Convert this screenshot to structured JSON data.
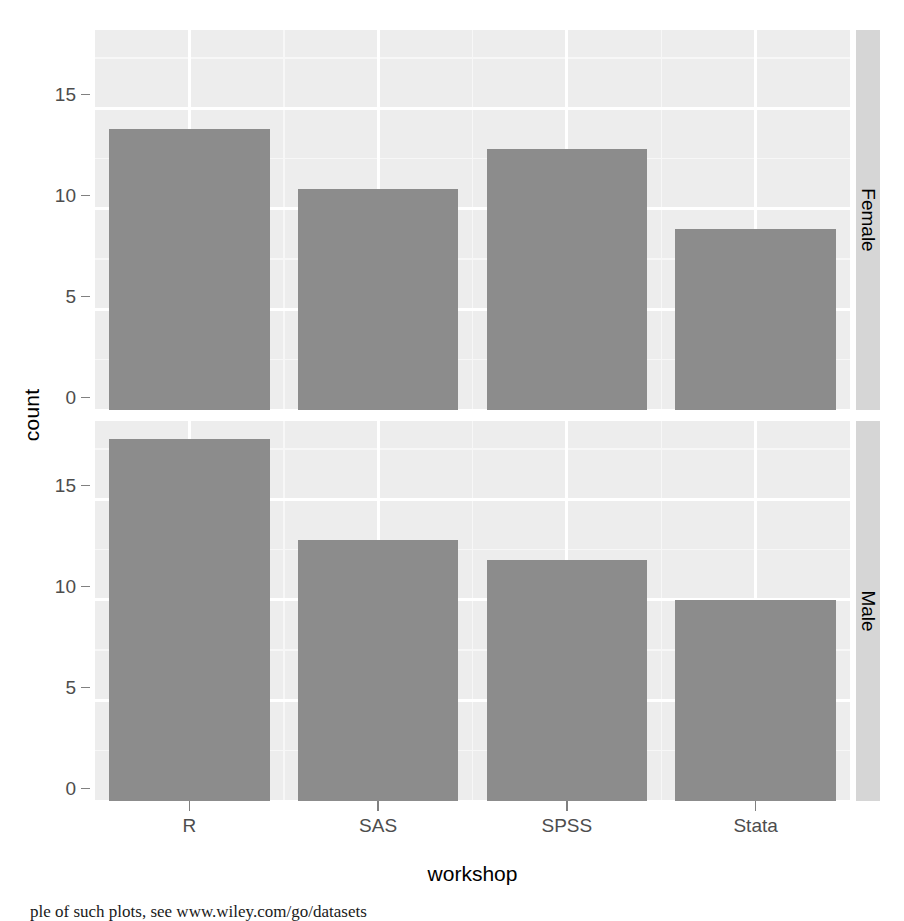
{
  "chart_data": {
    "type": "bar",
    "title": "",
    "subtitle": "",
    "xlabel": "workshop",
    "ylabel": "count",
    "categories": [
      "R",
      "SAS",
      "SPSS",
      "Stata"
    ],
    "facet_variable": "gender",
    "facet_layout": "rows",
    "facets": [
      {
        "name": "Female",
        "strip_label": "Female",
        "values": [
          14,
          11,
          13,
          9
        ]
      },
      {
        "name": "Male",
        "strip_label": "Male",
        "values": [
          18,
          13,
          12,
          10
        ]
      }
    ],
    "ylim": [
      0,
      18.9
    ],
    "yticks": [
      0,
      5,
      10,
      15
    ],
    "ytick_labels": [
      "0",
      "5",
      "10",
      "15"
    ],
    "y_minor_ticks": [
      2.5,
      7.5,
      12.5,
      17.5
    ],
    "xtick_labels": [
      "R",
      "SAS",
      "SPSS",
      "Stata"
    ],
    "grid": true,
    "legend": "none",
    "bar_color": "#8c8c8c",
    "panel_background": "#ededed",
    "gridline_color": "#ffffff",
    "strip_background": "#d6d6d6"
  },
  "axes": {
    "y_title": "count",
    "x_title": "workshop",
    "y_tick_labels": [
      "15",
      "10",
      "5",
      "0"
    ],
    "x_tick_labels": [
      "R",
      "SAS",
      "SPSS",
      "Stata"
    ]
  },
  "strips": {
    "top": "Female",
    "bottom": "Male"
  },
  "caption": {
    "text": "ple of such plots, see www.wiley.com/go/datasets"
  }
}
